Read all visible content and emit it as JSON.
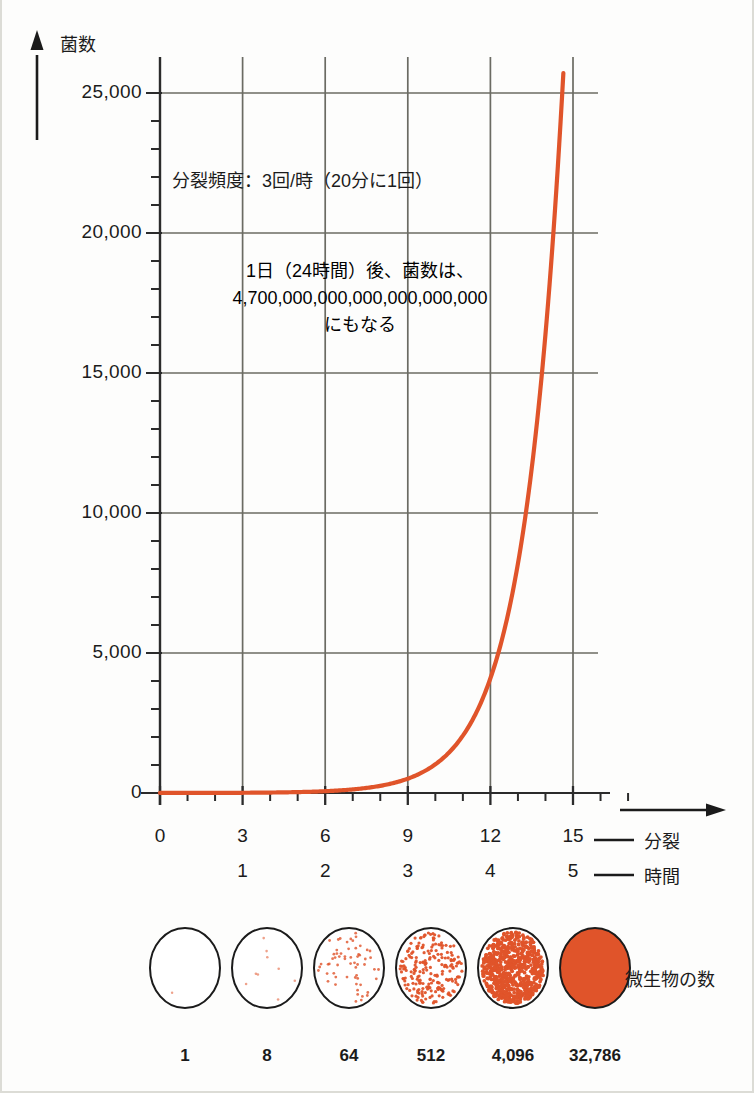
{
  "figure": {
    "y_axis_title": "菌数",
    "annotation_1": "分裂頻度：3回/時（20分に1回）",
    "annotation_2_line1": "1日（24時間）後、菌数は、",
    "annotation_2_line2": "4,700,000,000,000,000,000,000",
    "annotation_2_line3": "にもなる",
    "series_label_divisions": "分裂",
    "series_label_hours": "時間",
    "colony_caption": "微生物の数",
    "curve_color": "#E0542A",
    "grid_color": "#6b6b63",
    "axis_color": "#2b2b2b"
  },
  "chart_data": {
    "type": "line",
    "title": "",
    "xlabel": "分裂",
    "ylabel": "菌数",
    "xlim": [
      0,
      16.4
    ],
    "ylim": [
      0,
      26150
    ],
    "grid": true,
    "legend": "none",
    "x_tick_labels": [
      "0",
      "3",
      "6",
      "9",
      "12",
      "15"
    ],
    "x_tick_values": [
      0,
      3,
      6,
      9,
      12,
      15
    ],
    "x_secondary_tick_labels": [
      "1",
      "2",
      "3",
      "4",
      "5"
    ],
    "x_secondary_tick_values": [
      3,
      6,
      9,
      12,
      15
    ],
    "x_minor_interval": 1,
    "y_tick_labels": [
      "0",
      "5,000",
      "10,000",
      "15,000",
      "20,000",
      "25,000"
    ],
    "y_tick_values": [
      0,
      5000,
      10000,
      15000,
      20000,
      25000
    ],
    "y_minor_interval": 1000,
    "series": [
      {
        "name": "菌数",
        "formula": "2^x",
        "x": [
          0,
          1,
          2,
          3,
          4,
          5,
          6,
          7,
          8,
          9,
          10,
          11,
          12,
          13,
          14,
          14.67
        ],
        "values": [
          1,
          2,
          4,
          8,
          16,
          32,
          64,
          128,
          256,
          512,
          1024,
          2048,
          4096,
          8192,
          16384,
          26050
        ]
      }
    ]
  },
  "colonies": [
    {
      "count_label": "1",
      "count": 1,
      "density": 1
    },
    {
      "count_label": "8",
      "count": 8,
      "density": 8
    },
    {
      "count_label": "64",
      "count": 64,
      "density": 64
    },
    {
      "count_label": "512",
      "count": 512,
      "density": 512
    },
    {
      "count_label": "4,096",
      "count": 4096,
      "density": 4096
    },
    {
      "count_label": "32,786",
      "count": 32786,
      "density": 32786
    }
  ]
}
